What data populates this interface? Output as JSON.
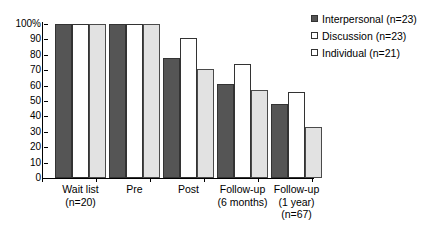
{
  "chart_data": {
    "type": "bar",
    "title": "",
    "subtitle": "",
    "xlabel": "",
    "ylabel": "",
    "ylim": [
      0,
      100
    ],
    "grid": false,
    "legend_position": "top-right",
    "categories": [
      "Wait list\n(n=20)",
      "Pre",
      "Post",
      "Follow-up\n(6 months)",
      "Follow-up\n(1 year)\n(n=67)"
    ],
    "category_lines": [
      [
        "Wait list",
        "(n=20)"
      ],
      [
        "Pre"
      ],
      [
        "Post"
      ],
      [
        "Follow-up",
        "(6 months)"
      ],
      [
        "Follow-up",
        "(1 year)",
        "(n=67)"
      ]
    ],
    "series": [
      {
        "name": "Interpersonal (n=23)",
        "color": "#555555",
        "values": [
          100,
          100,
          78,
          61,
          48
        ]
      },
      {
        "name": "Discussion (n=23)",
        "color": "#ffffff",
        "values": [
          100,
          100,
          91,
          74,
          56
        ]
      },
      {
        "name": "Individual (n=21)",
        "color": "#e2e2e2",
        "values": [
          100,
          100,
          71,
          57,
          33
        ]
      }
    ],
    "ytick_labels": [
      "100%",
      "90",
      "80",
      "70",
      "60",
      "50",
      "40",
      "30",
      "20",
      "10",
      "0"
    ],
    "ytick_values": [
      100,
      90,
      80,
      70,
      60,
      50,
      40,
      30,
      20,
      10,
      0
    ]
  },
  "legend": {
    "items": [
      {
        "label": "Interpersonal (n=23)",
        "swatch": "filled-dark-square-icon"
      },
      {
        "label": "Discussion (n=23)",
        "swatch": "open-square-icon"
      },
      {
        "label": "Individual (n=21)",
        "swatch": "open-square-icon"
      }
    ]
  }
}
